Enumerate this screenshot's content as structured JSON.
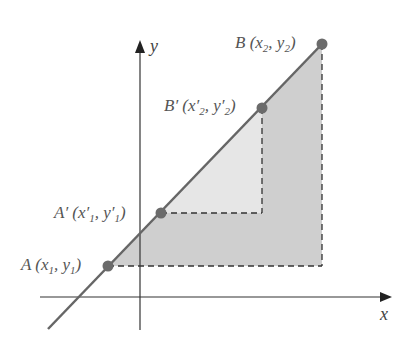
{
  "diagram": {
    "axes": {
      "x_label": "x",
      "y_label": "y"
    },
    "points": {
      "A": {
        "name": "A",
        "prime": "",
        "x": "x",
        "xs": "1",
        "y": "y",
        "ys": "1"
      },
      "A2": {
        "name": "A",
        "prime": "′",
        "x": "x′",
        "xs": "1",
        "y": "y′",
        "ys": "1"
      },
      "B2": {
        "name": "B",
        "prime": "′",
        "x": "x′",
        "xs": "2",
        "y": "y′",
        "ys": "2"
      },
      "B": {
        "name": "B",
        "prime": "",
        "x": "x",
        "xs": "2",
        "y": "y",
        "ys": "2"
      }
    },
    "colors": {
      "line": "#666666",
      "point": "#6b6b6b",
      "outer_fill": "#cfcfcf",
      "inner_fill": "#e4e4e4",
      "axis": "#333333"
    }
  }
}
